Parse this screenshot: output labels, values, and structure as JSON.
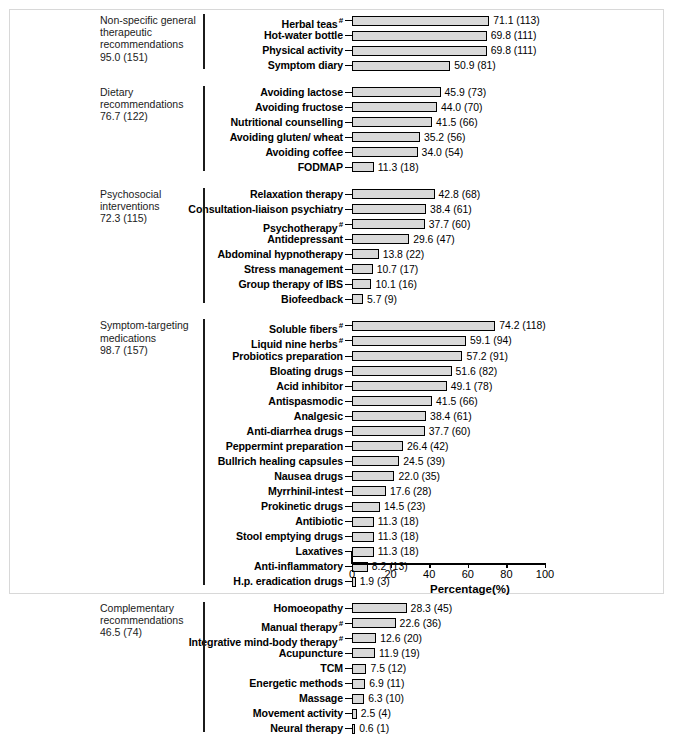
{
  "chart_data": {
    "type": "bar",
    "orientation": "horizontal",
    "title": "",
    "xlabel": "Percentage(%)",
    "ylabel": "",
    "xlim": [
      0,
      100
    ],
    "xticks": [
      0,
      20,
      40,
      60,
      80,
      100
    ],
    "grid": false,
    "legend": "none",
    "value_label_format": "percent (count)",
    "footnote_marker": "#",
    "groups": [
      {
        "name": "Non-specific general therapeutic recommendations",
        "summary_percent": 95.0,
        "summary_count": 151,
        "summary_label": "95.0 (151)",
        "items": [
          {
            "label": "Herbal teas",
            "marker": "#",
            "value": 71.1,
            "count": 113,
            "value_label": "71.1 (113)"
          },
          {
            "label": "Hot-water bottle",
            "marker": "",
            "value": 69.8,
            "count": 111,
            "value_label": "69.8 (111)"
          },
          {
            "label": "Physical activity",
            "marker": "",
            "value": 69.8,
            "count": 111,
            "value_label": "69.8 (111)"
          },
          {
            "label": "Symptom diary",
            "marker": "",
            "value": 50.9,
            "count": 81,
            "value_label": "50.9 (81)"
          }
        ]
      },
      {
        "name": "Dietary recommendations",
        "summary_percent": 76.7,
        "summary_count": 122,
        "summary_label": "76.7 (122)",
        "items": [
          {
            "label": "Avoiding lactose",
            "marker": "",
            "value": 45.9,
            "count": 73,
            "value_label": "45.9 (73)"
          },
          {
            "label": "Avoiding fructose",
            "marker": "",
            "value": 44.0,
            "count": 70,
            "value_label": "44.0 (70)"
          },
          {
            "label": "Nutritional counselling",
            "marker": "",
            "value": 41.5,
            "count": 66,
            "value_label": "41.5 (66)"
          },
          {
            "label": "Avoiding gluten/ wheat",
            "marker": "",
            "value": 35.2,
            "count": 56,
            "value_label": "35.2 (56)"
          },
          {
            "label": "Avoiding coffee",
            "marker": "",
            "value": 34.0,
            "count": 54,
            "value_label": "34.0 (54)"
          },
          {
            "label": "FODMAP",
            "marker": "",
            "value": 11.3,
            "count": 18,
            "value_label": "11.3 (18)"
          }
        ]
      },
      {
        "name": "Psychosocial interventions",
        "summary_percent": 72.3,
        "summary_count": 115,
        "summary_label": "72.3 (115)",
        "items": [
          {
            "label": "Relaxation therapy",
            "marker": "",
            "value": 42.8,
            "count": 68,
            "value_label": "42.8 (68)"
          },
          {
            "label": "Consultation-liaison psychiatry",
            "marker": "",
            "value": 38.4,
            "count": 61,
            "value_label": "38.4 (61)"
          },
          {
            "label": "Psychotherapy",
            "marker": "#",
            "value": 37.7,
            "count": 60,
            "value_label": "37.7 (60)"
          },
          {
            "label": "Antidepressant",
            "marker": "",
            "value": 29.6,
            "count": 47,
            "value_label": "29.6 (47)"
          },
          {
            "label": "Abdominal hypnotherapy",
            "marker": "",
            "value": 13.8,
            "count": 22,
            "value_label": "13.8 (22)"
          },
          {
            "label": "Stress management",
            "marker": "",
            "value": 10.7,
            "count": 17,
            "value_label": "10.7 (17)"
          },
          {
            "label": "Group therapy of IBS",
            "marker": "",
            "value": 10.1,
            "count": 16,
            "value_label": "10.1 (16)"
          },
          {
            "label": "Biofeedback",
            "marker": "",
            "value": 5.7,
            "count": 9,
            "value_label": "5.7 (9)"
          }
        ]
      },
      {
        "name": "Symptom-targeting medications",
        "summary_percent": 98.7,
        "summary_count": 157,
        "summary_label": "98.7 (157)",
        "items": [
          {
            "label": "Soluble fibers",
            "marker": "#",
            "value": 74.2,
            "count": 118,
            "value_label": "74.2 (118)"
          },
          {
            "label": "Liquid nine herbs",
            "marker": "#",
            "value": 59.1,
            "count": 94,
            "value_label": "59.1 (94)"
          },
          {
            "label": "Probiotics preparation",
            "marker": "",
            "value": 57.2,
            "count": 91,
            "value_label": "57.2 (91)"
          },
          {
            "label": "Bloating drugs",
            "marker": "",
            "value": 51.6,
            "count": 82,
            "value_label": "51.6 (82)"
          },
          {
            "label": "Acid inhibitor",
            "marker": "",
            "value": 49.1,
            "count": 78,
            "value_label": "49.1 (78)"
          },
          {
            "label": "Antispasmodic",
            "marker": "",
            "value": 41.5,
            "count": 66,
            "value_label": "41.5 (66)"
          },
          {
            "label": "Analgesic",
            "marker": "",
            "value": 38.4,
            "count": 61,
            "value_label": "38.4 (61)"
          },
          {
            "label": "Anti-diarrhea drugs",
            "marker": "",
            "value": 37.7,
            "count": 60,
            "value_label": "37.7 (60)"
          },
          {
            "label": "Peppermint preparation",
            "marker": "",
            "value": 26.4,
            "count": 42,
            "value_label": "26.4 (42)"
          },
          {
            "label": "Bullrich healing capsules",
            "marker": "",
            "value": 24.5,
            "count": 39,
            "value_label": "24.5 (39)"
          },
          {
            "label": "Nausea drugs",
            "marker": "",
            "value": 22.0,
            "count": 35,
            "value_label": "22.0 (35)"
          },
          {
            "label": "Myrrhinil-intest",
            "marker": "",
            "value": 17.6,
            "count": 28,
            "value_label": "17.6 (28)"
          },
          {
            "label": "Prokinetic drugs",
            "marker": "",
            "value": 14.5,
            "count": 23,
            "value_label": "14.5 (23)"
          },
          {
            "label": "Antibiotic",
            "marker": "",
            "value": 11.3,
            "count": 18,
            "value_label": "11.3 (18)"
          },
          {
            "label": "Stool emptying drugs",
            "marker": "",
            "value": 11.3,
            "count": 18,
            "value_label": "11.3 (18)"
          },
          {
            "label": "Laxatives",
            "marker": "",
            "value": 11.3,
            "count": 18,
            "value_label": "11.3 (18)"
          },
          {
            "label": "Anti-inflammatory",
            "marker": "",
            "value": 8.2,
            "count": 13,
            "value_label": "8.2 (13)"
          },
          {
            "label": "H.p. eradication drugs",
            "marker": "",
            "value": 1.9,
            "count": 3,
            "value_label": "1.9 (3)"
          }
        ]
      },
      {
        "name": "Complementary recommendations",
        "summary_percent": 46.5,
        "summary_count": 74,
        "summary_label": "46.5 (74)",
        "items": [
          {
            "label": "Homoeopathy",
            "marker": "",
            "value": 28.3,
            "count": 45,
            "value_label": "28.3 (45)"
          },
          {
            "label": "Manual therapy",
            "marker": "#",
            "value": 22.6,
            "count": 36,
            "value_label": "22.6 (36)"
          },
          {
            "label": "Integrative mind-body therapy",
            "marker": "#",
            "value": 12.6,
            "count": 20,
            "value_label": "12.6 (20)"
          },
          {
            "label": "Acupuncture",
            "marker": "",
            "value": 11.9,
            "count": 19,
            "value_label": "11.9 (19)"
          },
          {
            "label": "TCM",
            "marker": "",
            "value": 7.5,
            "count": 12,
            "value_label": "7.5 (12)"
          },
          {
            "label": "Energetic methods",
            "marker": "",
            "value": 6.9,
            "count": 11,
            "value_label": "6.9 (11)"
          },
          {
            "label": "Massage",
            "marker": "",
            "value": 6.3,
            "count": 10,
            "value_label": "6.3 (10)"
          },
          {
            "label": "Movement activity",
            "marker": "",
            "value": 2.5,
            "count": 4,
            "value_label": "2.5 (4)"
          },
          {
            "label": "Neural therapy",
            "marker": "",
            "value": 0.6,
            "count": 1,
            "value_label": "0.6 (1)"
          }
        ]
      }
    ],
    "colors": {
      "bar_fill": "#d9d9d9",
      "bar_stroke": "#000000",
      "axis": "#000000",
      "group_text": "#1b1b1b",
      "frame": "#d8d8d8"
    }
  }
}
